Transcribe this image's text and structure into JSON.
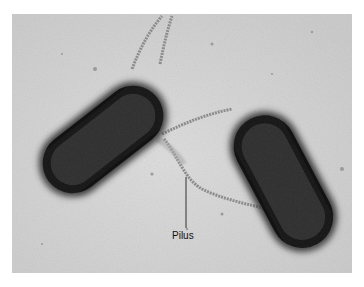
{
  "figure": {
    "type": "electron-micrograph",
    "background_color": "#d4d4d4",
    "cell_color": "#1e1e1e",
    "annotations": [
      {
        "label": "Pilus",
        "points_to": "pilus between the two bacterial cells"
      }
    ]
  }
}
